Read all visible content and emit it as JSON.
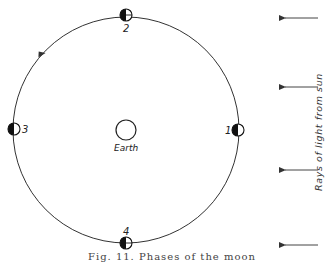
{
  "diagram": {
    "orbit": {
      "cx": 126,
      "cy": 130,
      "r": 113,
      "stroke": "#333333",
      "direction": "counterclockwise"
    },
    "earth": {
      "cx": 126,
      "cy": 130,
      "r": 10,
      "label": "Earth"
    },
    "moons": [
      {
        "id": "1",
        "label": "1",
        "cx": 238,
        "cy": 130,
        "r": 6,
        "label_pos": "left"
      },
      {
        "id": "2",
        "label": "2",
        "cx": 126,
        "cy": 15,
        "r": 6,
        "label_pos": "below"
      },
      {
        "id": "3",
        "label": "3",
        "cx": 14,
        "cy": 129,
        "r": 6,
        "label_pos": "right"
      },
      {
        "id": "4",
        "label": "4",
        "cx": 126,
        "cy": 243,
        "r": 6,
        "label_pos": "above"
      }
    ],
    "sun_rays": {
      "label": "Rays of light from sun",
      "arrows_y": [
        18,
        87,
        170,
        245
      ],
      "x_start": 318,
      "x_end": 282
    },
    "caption": "Fig. 11. Phases of the moon"
  }
}
